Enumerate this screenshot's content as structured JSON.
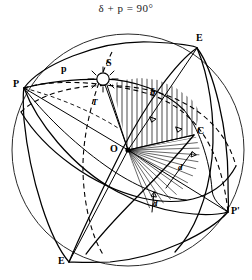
{
  "figure": {
    "title": "δ + p = 90°",
    "kind": "celestial-sphere-diagram",
    "background_color": "#ffffff",
    "line_color": "#000000",
    "sphere": {
      "center_x": 128,
      "center_y": 150,
      "radius": 116
    }
  },
  "labels": {
    "pole_left": "P",
    "pole_right": "P'",
    "equinox_top": "E",
    "equinox_bottom": "E",
    "point_c": "C",
    "center_o": "O",
    "star_s": "S",
    "aux_t": "T",
    "arc_p": "p",
    "angle_delta": "δ",
    "distance_d_upper": "d",
    "distance_d_lower": "d"
  },
  "label_positions": {
    "pole_left": {
      "x": 13,
      "y": 79
    },
    "pole_right": {
      "x": 231,
      "y": 206
    },
    "equinox_top": {
      "x": 196,
      "y": 36
    },
    "equinox_bottom": {
      "x": 58,
      "y": 256
    },
    "point_c": {
      "x": 196,
      "y": 127
    },
    "center_o": {
      "x": 110,
      "y": 145
    },
    "star_s": {
      "x": 106,
      "y": 61
    },
    "aux_t": {
      "x": 92,
      "y": 100
    },
    "arc_p": {
      "x": 62,
      "y": 69
    },
    "angle_delta": {
      "x": 150,
      "y": 90
    },
    "distance_d_upper": {
      "x": 179,
      "y": 164
    },
    "distance_d_lower": {
      "x": 154,
      "y": 200
    }
  },
  "points": {
    "P": {
      "x": 24,
      "y": 88
    },
    "P_prime": {
      "x": 228,
      "y": 212
    },
    "E_top": {
      "x": 197,
      "y": 48
    },
    "E_bottom": {
      "x": 69,
      "y": 262
    },
    "C": {
      "x": 194,
      "y": 135
    },
    "O": {
      "x": 128,
      "y": 150
    },
    "S": {
      "x": 103,
      "y": 79
    }
  },
  "colors": {
    "ink": "#000000",
    "sphere_edge": "#2a2a2a",
    "paper": "#ffffff"
  }
}
